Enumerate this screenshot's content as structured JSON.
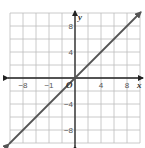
{
  "chart_data": {
    "type": "line",
    "title": "",
    "xlabel": "x",
    "ylabel": "y",
    "origin_label": "O",
    "xlim": [
      -10,
      10
    ],
    "ylim": [
      -10,
      10
    ],
    "grid": true,
    "grid_step": 2,
    "x_tick_labels": [
      {
        "value": -8,
        "label": "−8"
      },
      {
        "value": -4,
        "label": "−1"
      },
      {
        "value": 4,
        "label": "4"
      },
      {
        "value": 8,
        "label": "8"
      }
    ],
    "y_tick_labels": [
      {
        "value": 8,
        "label": "8"
      },
      {
        "value": 4,
        "label": "4"
      },
      {
        "value": -4,
        "label": "−4"
      },
      {
        "value": -8,
        "label": "−8"
      }
    ],
    "series": [
      {
        "name": "y = x",
        "x": [
          -10,
          0,
          10
        ],
        "y": [
          -10,
          0,
          10
        ],
        "arrows": "both"
      }
    ],
    "colors": {
      "grid": "#bdbdbd",
      "axis": "#222222",
      "line": "#555555"
    }
  }
}
